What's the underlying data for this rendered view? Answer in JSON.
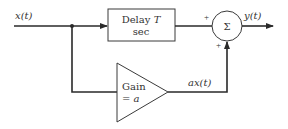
{
  "diagram": {
    "input_signal": "x(t)",
    "output_signal": "y(t)",
    "delay_block": {
      "line1": "Delay T",
      "line1_main": "Delay ",
      "line1_var": "T",
      "line2": "sec"
    },
    "gain_block": {
      "line1": "Gain",
      "line2": "= a"
    },
    "gain_output": "ax(t)",
    "summer": {
      "symbol": "Σ",
      "sign_top": "+",
      "sign_bottom": "+"
    }
  },
  "colors": {
    "line": "#2a2a2a",
    "text": "#333333",
    "background": "#ffffff"
  }
}
